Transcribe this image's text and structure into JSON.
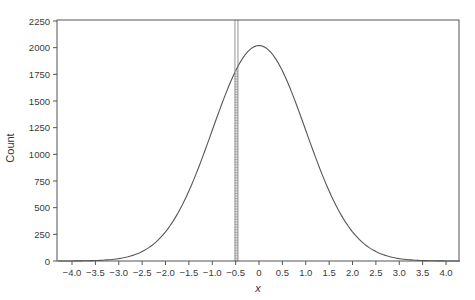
{
  "chart_data": {
    "type": "line",
    "title": "",
    "xlabel": "x",
    "ylabel": "Count",
    "xlim": [
      -4.3,
      4.3
    ],
    "ylim": [
      0,
      2250
    ],
    "grid": false,
    "legend": null,
    "x_ticks": [
      "-4.0",
      "-3.5",
      "-3.0",
      "-2.5",
      "-2.0",
      "-1.5",
      "-1.0",
      "-0.5",
      "0",
      "0.5",
      "1.0",
      "1.5",
      "2.0",
      "2.5",
      "3.0",
      "3.5",
      "4.0"
    ],
    "y_ticks": [
      "0",
      "250",
      "500",
      "750",
      "1000",
      "1250",
      "1500",
      "1750",
      "2000",
      "2250"
    ],
    "series": [
      {
        "name": "normal density curve",
        "peak": 2020,
        "mean": 0,
        "sd": 1,
        "x": [
          -4.0,
          -3.5,
          -3.0,
          -2.5,
          -2.0,
          -1.5,
          -1.0,
          -0.5,
          0,
          0.5,
          1.0,
          1.5,
          2.0,
          2.5,
          3.0,
          3.5,
          4.0
        ],
        "values": [
          1,
          4,
          22,
          89,
          273,
          656,
          1225,
          1783,
          2020,
          1783,
          1225,
          656,
          273,
          89,
          22,
          4,
          1
        ]
      }
    ],
    "highlighted_bin": {
      "x_start": -0.6,
      "x_end": -0.45,
      "height": 1783,
      "style": "hatched",
      "guide_lines_to_top": true
    }
  }
}
